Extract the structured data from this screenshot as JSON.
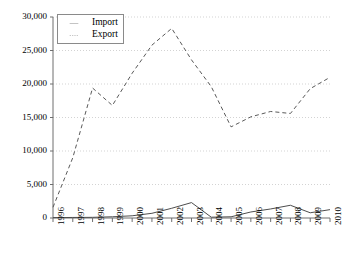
{
  "chart_data": {
    "type": "line",
    "title": "",
    "xlabel": "",
    "ylabel": "",
    "grid": true,
    "legend_position": "top-left",
    "categories": [
      "1996",
      "1997",
      "1998",
      "1999",
      "2000",
      "2001",
      "2002",
      "2003",
      "2004",
      "2005",
      "2006",
      "2007",
      "2008",
      "2009",
      "2010"
    ],
    "x": [
      1996,
      1997,
      1998,
      1999,
      2000,
      2001,
      2002,
      2003,
      2004,
      2005,
      2006,
      2007,
      2008,
      2009,
      2010
    ],
    "ylim": [
      0,
      30000
    ],
    "xlim": [
      1996,
      2010
    ],
    "ytick_labels": [
      "0",
      "5,000",
      "10,000",
      "15,000",
      "20,000",
      "25,000",
      "30,000"
    ],
    "ytick_values": [
      0,
      5000,
      10000,
      15000,
      20000,
      25000,
      30000
    ],
    "series": [
      {
        "name": "Import",
        "style": "solid",
        "color": "#4d4d4d",
        "values": [
          60,
          80,
          100,
          180,
          330,
          700,
          1450,
          2300,
          120,
          180,
          900,
          1350,
          1900,
          780,
          1250
        ]
      },
      {
        "name": "Export",
        "style": "dashed",
        "color": "#595959",
        "values": [
          1600,
          9000,
          19400,
          16800,
          21600,
          25800,
          28300,
          23600,
          19600,
          13600,
          15100,
          15900,
          15600,
          19300,
          21000
        ]
      }
    ]
  },
  "legend": {
    "entries": [
      {
        "label": "Import",
        "style": "solid"
      },
      {
        "label": "Export",
        "style": "dashed"
      }
    ]
  },
  "axes": {
    "y_labels": [
      "30,000",
      "25,000",
      "20,000",
      "15,000",
      "10,000",
      "5,000",
      "0"
    ],
    "x_labels": [
      "1996",
      "1997",
      "1998",
      "1999",
      "2000",
      "2001",
      "2002",
      "2003",
      "2004",
      "2005",
      "2006",
      "2007",
      "2008",
      "2009",
      "2010"
    ]
  },
  "colors": {
    "axis": "#6e6e6e",
    "grid": "#c8c8c8",
    "import_line": "#4d4d4d",
    "export_line": "#595959",
    "text": "#000000"
  }
}
